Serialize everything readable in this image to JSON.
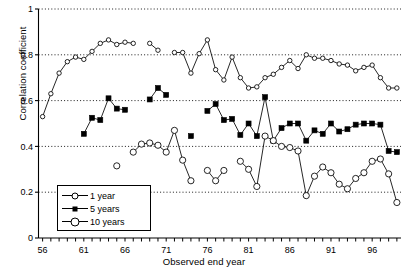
{
  "chart_data": {
    "type": "line",
    "title": "",
    "xlabel": "Observed end year",
    "ylabel": "Correlation coefficient",
    "xlim": [
      55.5,
      99.5
    ],
    "ylim": [
      0,
      1
    ],
    "xticks": [
      56,
      61,
      66,
      71,
      76,
      81,
      86,
      91,
      96
    ],
    "xtick_labels": [
      "56",
      "61",
      "66",
      "71",
      "76",
      "81",
      "86",
      "91",
      "96"
    ],
    "xtick_step_minor": 1,
    "yticks": [
      0,
      0.2,
      0.4,
      0.6,
      0.8,
      1
    ],
    "ytick_labels": [
      "0",
      "0.2",
      "0.4",
      "0.6",
      "0.8",
      "1"
    ],
    "grid": "horizontal-dotted",
    "gridlines": [
      0.2,
      0.4,
      0.6,
      0.8,
      1
    ],
    "legend_position": "lower-left-inside",
    "series": [
      {
        "name": "1 year",
        "marker": "open-circle-small",
        "color": "#000000",
        "points": [
          [
            56,
            0.53
          ],
          [
            57,
            0.63
          ],
          [
            58,
            0.72
          ],
          [
            59,
            0.77
          ],
          [
            60,
            0.79
          ],
          [
            61,
            0.78
          ],
          [
            62,
            0.815
          ],
          [
            63,
            0.85
          ],
          [
            64,
            0.865
          ],
          [
            65,
            0.845
          ],
          [
            66,
            0.855
          ],
          [
            67,
            0.85
          ],
          [
            69,
            0.85
          ],
          [
            70,
            0.82
          ],
          [
            72,
            0.81
          ],
          [
            73,
            0.81
          ],
          [
            74,
            0.72
          ],
          [
            75,
            0.805
          ],
          [
            76,
            0.865
          ],
          [
            77,
            0.735
          ],
          [
            78,
            0.69
          ],
          [
            79,
            0.79
          ],
          [
            80,
            0.7
          ],
          [
            81,
            0.655
          ],
          [
            82,
            0.66
          ],
          [
            83,
            0.7
          ],
          [
            84,
            0.715
          ],
          [
            85,
            0.745
          ],
          [
            86,
            0.775
          ],
          [
            87,
            0.74
          ],
          [
            88,
            0.8
          ],
          [
            89,
            0.785
          ],
          [
            90,
            0.785
          ],
          [
            91,
            0.775
          ],
          [
            92,
            0.76
          ],
          [
            93,
            0.755
          ],
          [
            94,
            0.73
          ],
          [
            95,
            0.745
          ],
          [
            96,
            0.755
          ],
          [
            97,
            0.7
          ],
          [
            98,
            0.655
          ],
          [
            99,
            0.655
          ]
        ]
      },
      {
        "name": "5 years",
        "marker": "filled-square",
        "color": "#000000",
        "points": [
          [
            61,
            0.455
          ],
          [
            62,
            0.525
          ],
          [
            63,
            0.515
          ],
          [
            64,
            0.61
          ],
          [
            65,
            0.565
          ],
          [
            66,
            0.56
          ],
          [
            69,
            0.605
          ],
          [
            70,
            0.655
          ],
          [
            71,
            0.625
          ],
          [
            74,
            0.445
          ],
          [
            76,
            0.555
          ],
          [
            77,
            0.585
          ],
          [
            78,
            0.515
          ],
          [
            79,
            0.52
          ],
          [
            80,
            0.45
          ],
          [
            81,
            0.5
          ],
          [
            82,
            0.445
          ],
          [
            83,
            0.615
          ],
          [
            84,
            0.425
          ],
          [
            85,
            0.48
          ],
          [
            86,
            0.5
          ],
          [
            87,
            0.5
          ],
          [
            88,
            0.425
          ],
          [
            89,
            0.47
          ],
          [
            90,
            0.455
          ],
          [
            91,
            0.5
          ],
          [
            92,
            0.465
          ],
          [
            93,
            0.475
          ],
          [
            94,
            0.495
          ],
          [
            95,
            0.5
          ],
          [
            96,
            0.5
          ],
          [
            97,
            0.495
          ],
          [
            98,
            0.38
          ],
          [
            99,
            0.375
          ]
        ]
      },
      {
        "name": "10 years",
        "marker": "open-circle-large",
        "color": "#000000",
        "points": [
          [
            65,
            0.315
          ],
          [
            67,
            0.375
          ],
          [
            68,
            0.41
          ],
          [
            69,
            0.415
          ],
          [
            70,
            0.405
          ],
          [
            71,
            0.375
          ],
          [
            72,
            0.47
          ],
          [
            73,
            0.34
          ],
          [
            74,
            0.25
          ],
          [
            76,
            0.295
          ],
          [
            77,
            0.25
          ],
          [
            78,
            0.295
          ],
          [
            80,
            0.335
          ],
          [
            81,
            0.3
          ],
          [
            82,
            0.225
          ],
          [
            83,
            0.445
          ],
          [
            84,
            0.425
          ],
          [
            85,
            0.4
          ],
          [
            86,
            0.395
          ],
          [
            87,
            0.38
          ],
          [
            88,
            0.185
          ],
          [
            89,
            0.27
          ],
          [
            90,
            0.31
          ],
          [
            91,
            0.285
          ],
          [
            92,
            0.235
          ],
          [
            93,
            0.215
          ],
          [
            94,
            0.26
          ],
          [
            95,
            0.285
          ],
          [
            96,
            0.335
          ],
          [
            97,
            0.345
          ],
          [
            98,
            0.28
          ],
          [
            99,
            0.155
          ]
        ]
      }
    ]
  },
  "legend": {
    "items": [
      {
        "label": "1 year",
        "marker": "open-circle-small"
      },
      {
        "label": "5 years",
        "marker": "filled-square"
      },
      {
        "label": "10 years",
        "marker": "open-circle-large"
      }
    ]
  }
}
